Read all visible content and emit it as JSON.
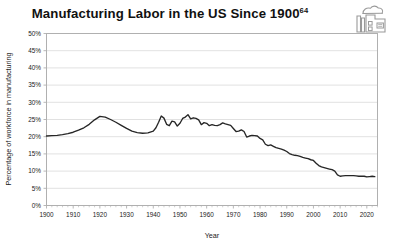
{
  "title": {
    "text": "Manufacturing Labor in the US Since 1900",
    "footnote_marker": "64"
  },
  "icon": {
    "name": "factory-icon",
    "label": "factory-icon"
  },
  "colors": {
    "line": "#262626",
    "grid": "#d9d9d9",
    "frame": "#b0b0b0",
    "text": "#1a1a1a",
    "background": "#ffffff"
  },
  "chart_data": {
    "type": "line",
    "title": "Manufacturing Labor in the US Since 1900",
    "xlabel": "Year",
    "ylabel": "Percentage of workforce in manufacturing",
    "xlim": [
      1900,
      2024
    ],
    "ylim": [
      0,
      50
    ],
    "grid": true,
    "legend": false,
    "xticks": [
      1900,
      1910,
      1920,
      1930,
      1940,
      1950,
      1960,
      1970,
      1980,
      1990,
      2000,
      2010,
      2020
    ],
    "xtick_labels": [
      "1900",
      "1910",
      "1920",
      "1930",
      "1940",
      "1950",
      "1960",
      "1970",
      "1980",
      "1990",
      "2000",
      "2010",
      "2020"
    ],
    "yticks": [
      0,
      5,
      10,
      15,
      20,
      25,
      30,
      35,
      40,
      45,
      50
    ],
    "ytick_labels": [
      "0%",
      "5%",
      "10%",
      "15%",
      "20%",
      "25%",
      "30%",
      "35%",
      "40%",
      "45%",
      "50%"
    ],
    "series": [
      {
        "name": "Percentage of workforce in manufacturing",
        "x": [
          1900,
          1902,
          1904,
          1906,
          1908,
          1910,
          1912,
          1914,
          1916,
          1918,
          1920,
          1922,
          1924,
          1926,
          1928,
          1930,
          1932,
          1934,
          1936,
          1938,
          1940,
          1941,
          1942,
          1943,
          1944,
          1945,
          1946,
          1947,
          1948,
          1949,
          1950,
          1951,
          1952,
          1953,
          1954,
          1955,
          1956,
          1957,
          1958,
          1959,
          1960,
          1961,
          1962,
          1963,
          1964,
          1965,
          1966,
          1967,
          1968,
          1969,
          1970,
          1971,
          1972,
          1973,
          1974,
          1975,
          1976,
          1977,
          1978,
          1979,
          1980,
          1981,
          1982,
          1983,
          1984,
          1985,
          1986,
          1987,
          1988,
          1989,
          1990,
          1991,
          1992,
          1993,
          1994,
          1995,
          1996,
          1997,
          1998,
          1999,
          2000,
          2001,
          2002,
          2003,
          2004,
          2005,
          2006,
          2007,
          2008,
          2009,
          2010,
          2011,
          2012,
          2013,
          2014,
          2015,
          2016,
          2017,
          2018,
          2019,
          2020,
          2021,
          2022,
          2023
        ],
        "y": [
          20.2,
          20.3,
          20.4,
          20.6,
          20.9,
          21.3,
          21.9,
          22.6,
          23.6,
          24.9,
          25.9,
          25.7,
          25.0,
          24.2,
          23.3,
          22.4,
          21.6,
          21.2,
          21.0,
          21.1,
          21.6,
          22.6,
          24.2,
          26.0,
          25.4,
          23.6,
          23.2,
          24.5,
          24.3,
          23.1,
          23.9,
          25.3,
          25.7,
          26.4,
          25.2,
          25.5,
          25.3,
          24.9,
          23.5,
          24.1,
          23.9,
          23.2,
          23.5,
          23.3,
          23.2,
          23.5,
          24.0,
          23.7,
          23.5,
          23.3,
          22.4,
          21.5,
          21.6,
          22.0,
          21.5,
          19.9,
          20.2,
          20.4,
          20.3,
          20.2,
          19.5,
          19.1,
          17.8,
          17.4,
          17.6,
          17.2,
          16.8,
          16.6,
          16.4,
          16.1,
          15.7,
          15.1,
          14.8,
          14.6,
          14.5,
          14.3,
          14.0,
          13.8,
          13.6,
          13.3,
          13.1,
          12.3,
          11.6,
          11.2,
          11.0,
          10.8,
          10.6,
          10.4,
          10.0,
          8.9,
          8.5,
          8.6,
          8.7,
          8.7,
          8.7,
          8.7,
          8.6,
          8.5,
          8.5,
          8.5,
          8.3,
          8.4,
          8.5,
          8.4
        ]
      }
    ]
  }
}
